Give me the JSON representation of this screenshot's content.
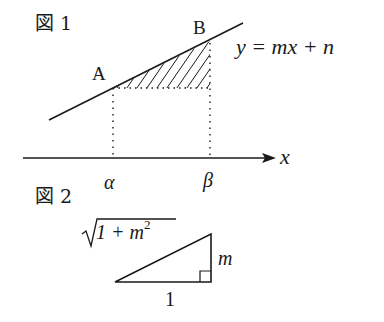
{
  "figure1": {
    "label": "図 1",
    "point_a": "A",
    "point_b": "B",
    "line_equation": "y = mx + n",
    "x_axis_label": "x",
    "alpha_label": "α",
    "beta_label": "β"
  },
  "figure2": {
    "label": "図 2",
    "hypotenuse_label": "1 + m²",
    "hyp_base": "1 + m",
    "hyp_exp": "2",
    "vertical_label": "m",
    "base_label": "1"
  },
  "colors": {
    "ink": "#1a1a1a",
    "background": "#ffffff"
  }
}
